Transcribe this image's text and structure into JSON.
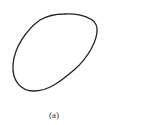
{
  "figure": {
    "caption": "(a)",
    "shape": "closed-curve",
    "stroke_color": "#222222",
    "background": "#ffffff"
  }
}
